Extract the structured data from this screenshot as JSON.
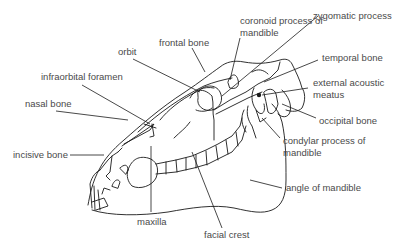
{
  "diagram": {
    "labels": {
      "coronoid_process": "coronoid process of mandible",
      "coronoid_line1": "coronoid process of",
      "coronoid_line2": "mandible",
      "zygomatic_process": "zygomatic process",
      "frontal_bone": "frontal bone",
      "orbit": "orbit",
      "temporal_bone": "temporal bone",
      "infraorbital_foramen": "infraorbital foramen",
      "external_acoustic_line1": "external acoustic",
      "external_acoustic_line2": "meatus",
      "nasal_bone": "nasal bone",
      "occipital_bone": "occipital bone",
      "condylar_line1": "condylar process of",
      "condylar_line2": "mandible",
      "incisive_bone": "incisive bone",
      "angle_of_mandible": "angle of mandible",
      "maxilla": "maxilla",
      "facial_crest": "facial crest"
    },
    "colors": {
      "text": "#4a4a4a",
      "line": "#1a1a1a",
      "background": "#ffffff"
    }
  }
}
